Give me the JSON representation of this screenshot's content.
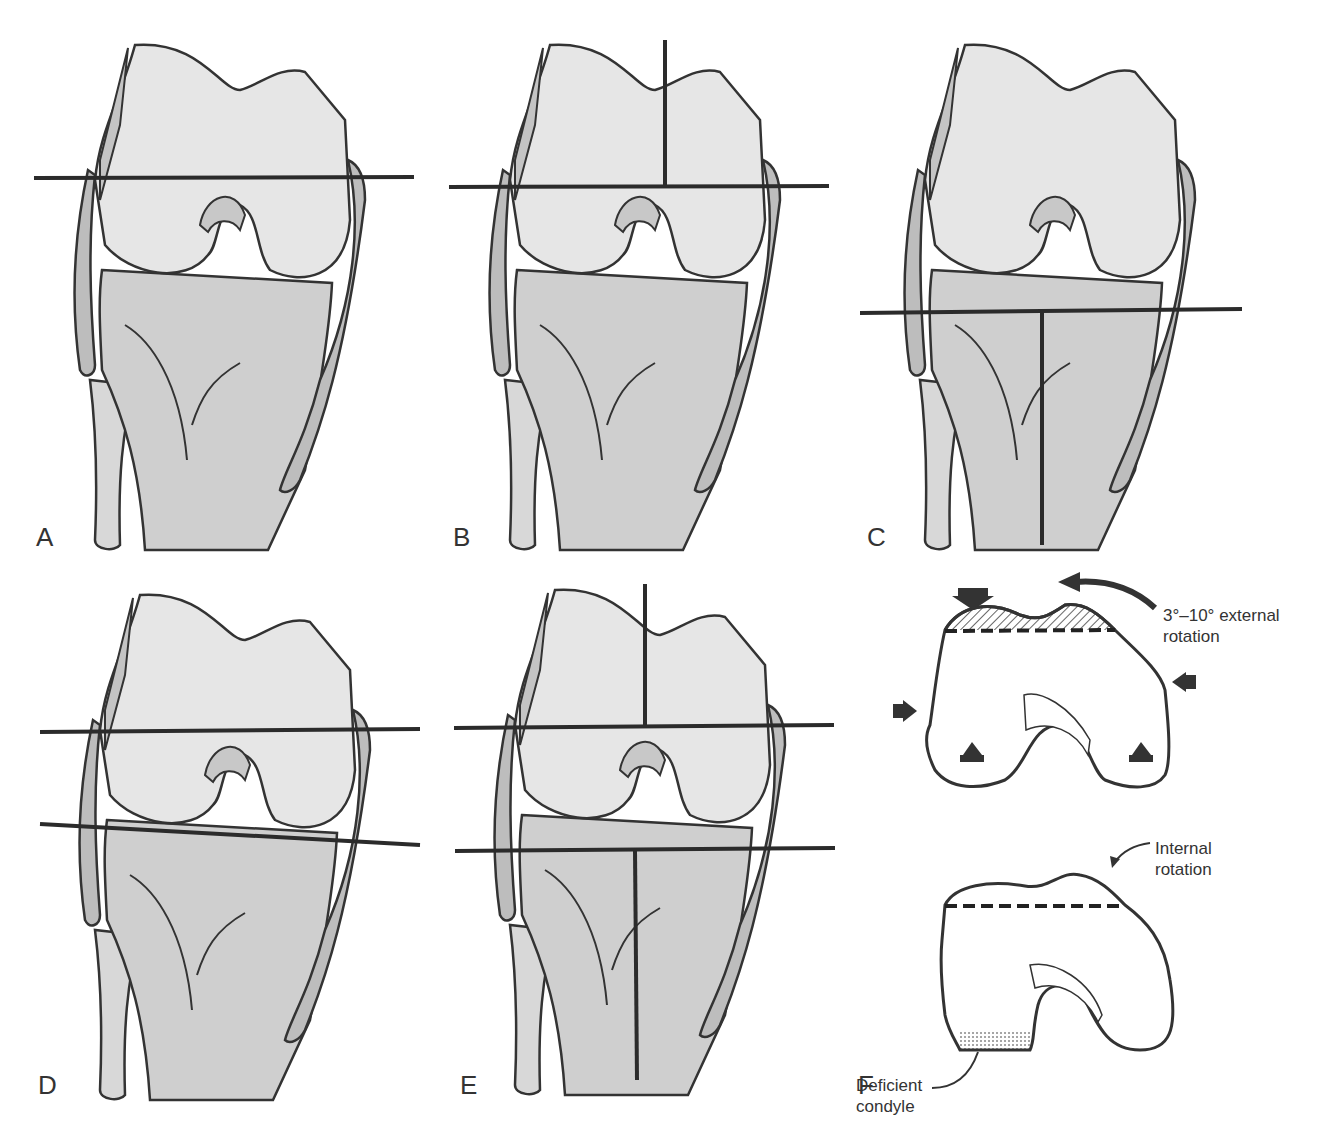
{
  "figure": {
    "panels": [
      {
        "id": "A",
        "label": "A",
        "femur_line": "horizontal",
        "femur_axis": false,
        "tibia_line": "none",
        "tibia_axis": false
      },
      {
        "id": "B",
        "label": "B",
        "femur_line": "horizontal",
        "femur_axis": true,
        "tibia_line": "none",
        "tibia_axis": false
      },
      {
        "id": "C",
        "label": "C",
        "femur_line": "none",
        "femur_axis": false,
        "tibia_line": "horizontal",
        "tibia_axis": true
      },
      {
        "id": "D",
        "label": "D",
        "femur_line": "horizontal",
        "femur_axis": false,
        "tibia_line": "tilted",
        "tibia_axis": false
      },
      {
        "id": "E",
        "label": "E",
        "femur_line": "horizontal",
        "femur_axis": true,
        "tibia_line": "horizontal",
        "tibia_axis": true
      },
      {
        "id": "F",
        "label": "F"
      }
    ],
    "annotations": {
      "external_rotation_line1": "3°–10° external",
      "external_rotation_line2": "rotation",
      "internal_rotation_line1": "Internal",
      "internal_rotation_line2": "rotation",
      "deficient_line1": "Deficient",
      "deficient_line2": "condyle"
    },
    "colors": {
      "femur_fill": "#e6e6e6",
      "tibia_fill": "#cfcfcf",
      "ligament_fill": "#bdbdbd",
      "outline": "#333333",
      "cut_line": "#2b2b2b"
    }
  }
}
